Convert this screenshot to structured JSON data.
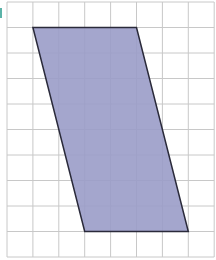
{
  "diagram": {
    "type": "grid-with-parallelogram",
    "grid": {
      "columns": 8,
      "rows": 10,
      "origin_px": [
        7,
        2
      ],
      "cell_width_px": 25.9,
      "cell_height_px": 25.5,
      "line_color": "#c8c8c8",
      "background": "#ffffff"
    },
    "shape": {
      "name": "parallelogram",
      "vertices_grid": [
        [
          1,
          1
        ],
        [
          5,
          1
        ],
        [
          7,
          9
        ],
        [
          3,
          9
        ]
      ],
      "fill": "#9a9cc8",
      "stroke": "#2a2a3a",
      "stroke_width": 1.5
    },
    "edge_mark_color": "#5bb3a8"
  }
}
